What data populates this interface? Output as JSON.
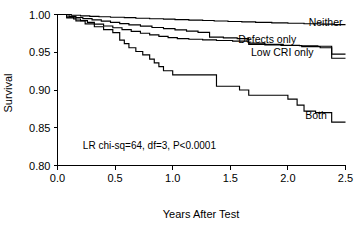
{
  "chart_data": {
    "type": "line",
    "title": "",
    "subtitle": "",
    "xlabel": "Years After Test",
    "ylabel": "Survival",
    "xlim": [
      0.0,
      2.5
    ],
    "ylim": [
      0.8,
      1.0
    ],
    "grid": false,
    "legend_position": "inline-right-of-curve-ends",
    "step_type": "post",
    "xticks": [
      0.0,
      0.5,
      1.0,
      1.5,
      2.0,
      2.5
    ],
    "xtick_labels": [
      "0.0",
      "0.5",
      "1.0",
      "1.5",
      "2.0",
      "2.5"
    ],
    "yticks": [
      0.8,
      0.85,
      0.9,
      0.95,
      1.0
    ],
    "ytick_labels": [
      "0.80",
      "0.85",
      "0.90",
      "0.95",
      "1.00"
    ],
    "annotations": [
      {
        "name": "log-rank-statistic",
        "text": "LR chi-sq=64, df=3, P<0.0001",
        "x": 0.22,
        "y": 0.822
      }
    ],
    "series": [
      {
        "name": "Neither",
        "label": "Neither",
        "label_x": 2.18,
        "label_y": 0.9845,
        "color": "#000000",
        "x": [
          0.0,
          0.12,
          0.2,
          0.28,
          0.36,
          0.46,
          0.58,
          0.68,
          0.8,
          0.92,
          1.02,
          1.14,
          1.26,
          1.36,
          1.48,
          1.6,
          1.72,
          1.86,
          2.0,
          2.14,
          2.28,
          2.4,
          2.5
        ],
        "y": [
          1.0,
          0.999,
          0.9982,
          0.9976,
          0.997,
          0.9964,
          0.9958,
          0.995,
          0.9944,
          0.9938,
          0.9932,
          0.9926,
          0.992,
          0.9914,
          0.9908,
          0.9902,
          0.9896,
          0.989,
          0.9884,
          0.9878,
          0.9872,
          0.9866,
          0.9866
        ]
      },
      {
        "name": "Defects only",
        "label": "Defects only",
        "label_x": 1.57,
        "label_y": 0.962,
        "color": "#000000",
        "x": [
          0.0,
          0.1,
          0.16,
          0.22,
          0.3,
          0.38,
          0.46,
          0.54,
          0.62,
          0.72,
          0.82,
          0.92,
          1.02,
          1.12,
          1.22,
          1.32,
          1.44,
          1.56,
          1.66,
          1.8,
          1.96,
          2.12,
          2.28,
          2.38,
          2.5
        ],
        "y": [
          1.0,
          0.9975,
          0.996,
          0.9945,
          0.9928,
          0.9912,
          0.9896,
          0.988,
          0.9862,
          0.9846,
          0.9828,
          0.9812,
          0.9796,
          0.978,
          0.9764,
          0.97,
          0.969,
          0.968,
          0.962,
          0.9605,
          0.959,
          0.9575,
          0.956,
          0.9475,
          0.9475
        ]
      },
      {
        "name": "Low CRI only",
        "label": "Low CRI only",
        "label_x": 1.68,
        "label_y": 0.9455,
        "color": "#000000",
        "x": [
          0.0,
          0.08,
          0.14,
          0.2,
          0.26,
          0.32,
          0.4,
          0.48,
          0.56,
          0.64,
          0.72,
          0.8,
          0.88,
          0.96,
          1.04,
          1.14,
          1.26,
          1.38,
          1.52,
          1.66,
          1.8,
          1.94,
          2.1,
          2.26,
          2.38,
          2.5
        ],
        "y": [
          1.0,
          0.9965,
          0.994,
          0.9918,
          0.9896,
          0.9872,
          0.9848,
          0.9824,
          0.98,
          0.9776,
          0.9752,
          0.973,
          0.971,
          0.9694,
          0.968,
          0.9672,
          0.9664,
          0.9656,
          0.9648,
          0.9605,
          0.9598,
          0.9592,
          0.9586,
          0.958,
          0.942,
          0.942
        ]
      },
      {
        "name": "Both",
        "label": "Both",
        "label_x": 2.15,
        "label_y": 0.8615,
        "color": "#000000",
        "x": [
          0.0,
          0.08,
          0.16,
          0.24,
          0.32,
          0.4,
          0.48,
          0.54,
          0.58,
          0.62,
          0.68,
          0.74,
          0.8,
          0.84,
          0.88,
          0.92,
          1.0,
          1.12,
          1.24,
          1.32,
          1.38,
          1.48,
          1.58,
          1.66,
          1.74,
          1.86,
          2.0,
          2.08,
          2.14,
          2.24,
          2.38,
          2.5
        ],
        "y": [
          1.0,
          0.9955,
          0.9915,
          0.9876,
          0.9838,
          0.98,
          0.976,
          0.966,
          0.9615,
          0.956,
          0.951,
          0.9465,
          0.941,
          0.936,
          0.931,
          0.9255,
          0.92,
          0.92,
          0.92,
          0.92,
          0.905,
          0.905,
          0.9,
          0.893,
          0.893,
          0.893,
          0.888,
          0.88,
          0.872,
          0.87,
          0.8575,
          0.8575
        ]
      }
    ]
  },
  "axes": {
    "y_title": "Survival",
    "x_title": "Years After Test"
  }
}
